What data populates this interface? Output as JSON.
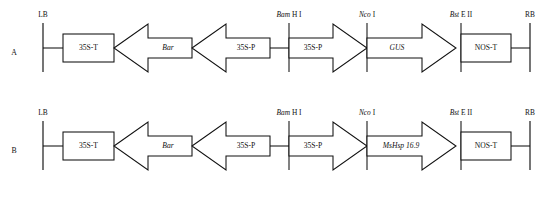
{
  "figure": {
    "rows": [
      {
        "row_label": "A",
        "left_border": "LB",
        "right_border": "RB",
        "elements": [
          {
            "name": "35S-T",
            "label": "35S-T",
            "shape": "box",
            "italic": false
          },
          {
            "name": "Bar",
            "label": "Bar",
            "shape": "arrow-left",
            "italic": true
          },
          {
            "name": "35S-P-left",
            "label": "35S-P",
            "shape": "arrow-left",
            "italic": false
          },
          {
            "name": "35S-P-right",
            "label": "35S-P",
            "shape": "arrow-right",
            "italic": false
          },
          {
            "name": "GUS",
            "label": "GUS",
            "shape": "arrow-right",
            "italic": true
          },
          {
            "name": "NOS-T",
            "label": "NOS-T",
            "shape": "box",
            "italic": false
          }
        ],
        "sites": [
          {
            "name": "bam-hi",
            "enzyme": "Bam",
            "suffix": " H I"
          },
          {
            "name": "nco-i",
            "enzyme": "Nco",
            "suffix": " I"
          },
          {
            "name": "bst-eii",
            "enzyme": "Bst",
            "suffix": " E II"
          }
        ]
      },
      {
        "row_label": "B",
        "left_border": "LB",
        "right_border": "RB",
        "elements": [
          {
            "name": "35S-T",
            "label": "35S-T",
            "shape": "box",
            "italic": false
          },
          {
            "name": "Bar",
            "label": "Bar",
            "shape": "arrow-left",
            "italic": true
          },
          {
            "name": "35S-P-left",
            "label": "35S-P",
            "shape": "arrow-left",
            "italic": false
          },
          {
            "name": "35S-P-right",
            "label": "35S-P",
            "shape": "arrow-right",
            "italic": false
          },
          {
            "name": "MsHsp16.9",
            "label": "MsHsp 16.9",
            "shape": "arrow-right",
            "italic": true
          },
          {
            "name": "NOS-T",
            "label": "NOS-T",
            "shape": "box",
            "italic": false
          }
        ],
        "sites": [
          {
            "name": "bam-hi",
            "enzyme": "Bam",
            "suffix": " H I"
          },
          {
            "name": "nco-i",
            "enzyme": "Nco",
            "suffix": " I"
          },
          {
            "name": "bst-eii",
            "enzyme": "Bst",
            "suffix": " E II"
          }
        ]
      }
    ],
    "colors": {
      "stroke": "#111111",
      "fill": "#ffffff",
      "background": "#ffffff"
    }
  }
}
